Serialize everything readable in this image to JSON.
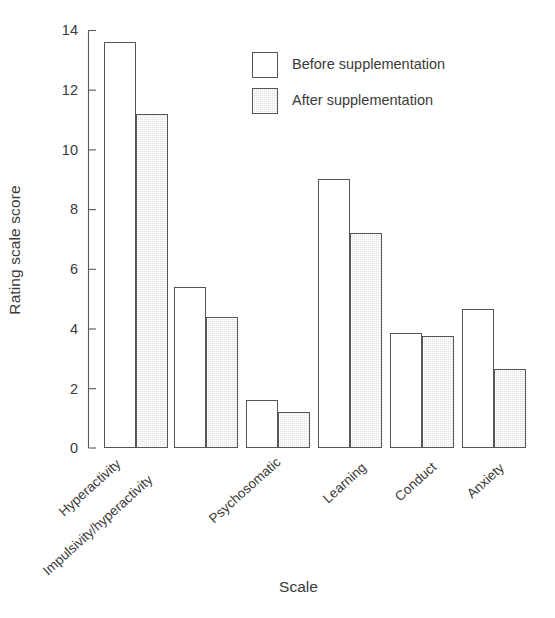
{
  "chart_data": {
    "type": "bar",
    "title": "",
    "subtitle": "",
    "xlabel": "Scale",
    "ylabel": "Rating scale score",
    "categories": [
      "Hyperactivity",
      "Impulsivity/hyperactivity",
      "Psychosomatic",
      "Learning",
      "Conduct",
      "Anxiety"
    ],
    "series": [
      {
        "name": "Before supplementation",
        "color": "#ffffff",
        "values": [
          13.6,
          5.4,
          1.6,
          9.0,
          3.85,
          4.65
        ]
      },
      {
        "name": "After supplementation",
        "color": "#e2e2e2",
        "values": [
          11.2,
          4.4,
          1.2,
          7.2,
          3.75,
          2.65
        ]
      }
    ],
    "ylim": [
      0,
      14
    ],
    "yticks": [
      0,
      2,
      4,
      6,
      8,
      10,
      12,
      14
    ],
    "ytick_labels": [
      "0",
      "2",
      "4",
      "6",
      "8",
      "10",
      "12",
      "14"
    ],
    "grid": false,
    "legend_position": "upper right",
    "annotations": []
  },
  "legend": {
    "entries": [
      {
        "label": "Before supplementation",
        "swatch": "legend-swatch-before"
      },
      {
        "label": "After supplementation",
        "swatch": "legend-swatch-after"
      }
    ]
  }
}
